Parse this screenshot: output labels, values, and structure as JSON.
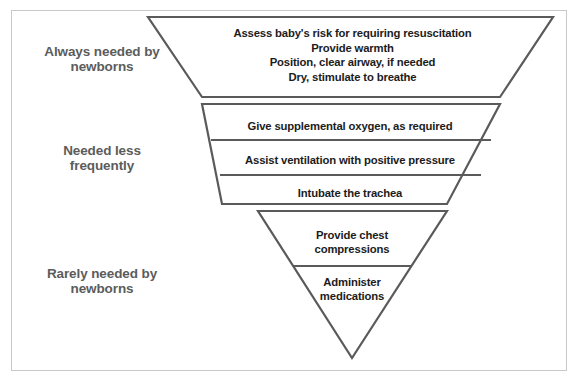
{
  "diagram": {
    "type": "inverted-pyramid",
    "background_color": "#ffffff",
    "frame_border_color": "#c9c9c9",
    "shape_stroke_color": "#5a5a5a",
    "side_label_color": "#5c5c5c",
    "band_text_color": "#1c1c1c"
  },
  "side_labels": [
    {
      "id": "always",
      "line1": "Always needed by",
      "line2": "newborns"
    },
    {
      "id": "less",
      "line1": "Needed less",
      "line2": "frequently"
    },
    {
      "id": "rarely",
      "line1": "Rarely needed by",
      "line2": "newborns"
    }
  ],
  "bands": [
    {
      "id": "band-always",
      "frequency_label": "Always needed by newborns",
      "lines": [
        "Assess baby's risk for requiring resuscitation",
        "Provide warmth",
        "Position, clear airway, if needed",
        "Dry, stimulate to breathe"
      ]
    },
    {
      "id": "band-less-frequent",
      "frequency_label": "Needed less frequently",
      "rows": [
        "Give supplemental oxygen, as required",
        "Assist ventilation with positive pressure",
        "Intubate the trachea"
      ]
    },
    {
      "id": "band-rarely",
      "frequency_label": "Rarely needed by newborns",
      "rows": [
        {
          "line1": "Provide chest",
          "line2": "compressions"
        },
        {
          "line1": "Administer",
          "line2": "medications"
        }
      ]
    }
  ]
}
